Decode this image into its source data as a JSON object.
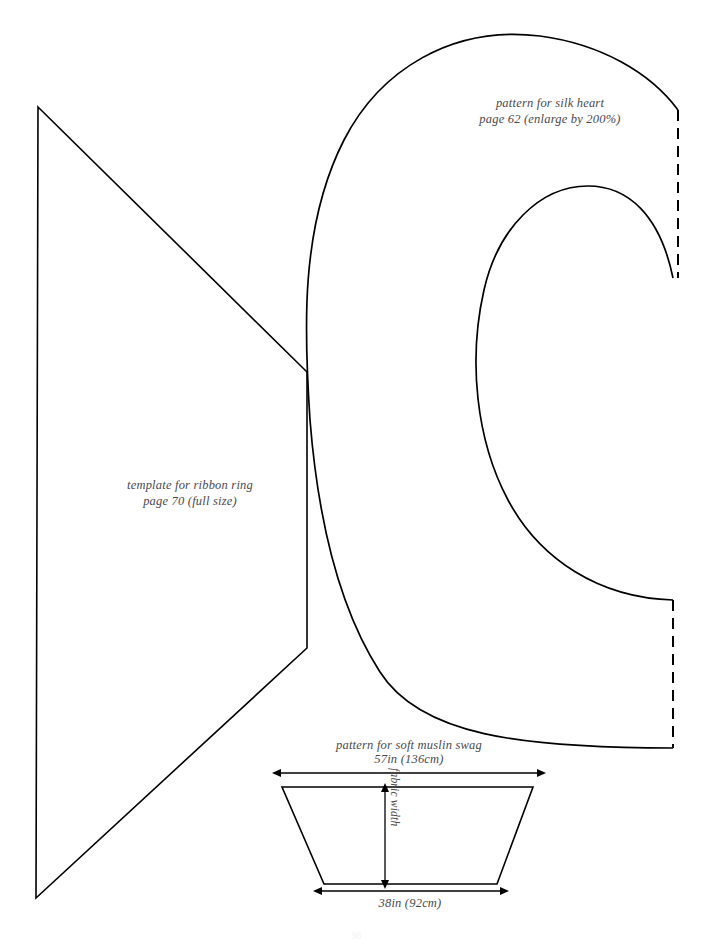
{
  "page": {
    "width": 713,
    "height": 948,
    "background": "#ffffff",
    "ink_color": "#000000",
    "text_color": "#4a4a4a",
    "page_number": "96"
  },
  "labels": {
    "silk_heart": {
      "line1": "pattern for silk heart",
      "line2": "page 62 (enlarge by 200%)"
    },
    "ribbon_ring": {
      "line1": "template for ribbon ring",
      "line2": "page 70 (full size)"
    },
    "muslin_swag": {
      "title": "pattern for soft muslin swag",
      "top_dimension": "57in (136cm)",
      "bottom_dimension": "38in (92cm)",
      "vertical_dimension": "fabric width"
    }
  },
  "shapes": {
    "ribbon_ring_template": {
      "name": "ribbon-ring-quadrilateral",
      "points": "38,107 307,372 307,648 36,898"
    },
    "silk_heart_pattern": {
      "name": "silk-heart-c-curve",
      "outer_curve": "M 678,110 C 650,72 600,44 540,36 C 452,25 380,70 344,140 C 300,226 304,330 310,420 C 318,520 340,610 380,672 C 420,735 520,748 673,748",
      "inner_curve": "M 673,600 C 600,598 540,560 508,500 C 476,440 468,360 484,290 C 498,228 540,186 588,186 C 628,186 660,215 673,278",
      "dashed_upper": "M 678,110 L 678,278",
      "dashed_lower": "M 673,600 L 673,748"
    },
    "muslin_swag_trapezoid": {
      "name": "muslin-swag-trapezoid",
      "points": "282,787 533,787 497,884 324,884"
    },
    "dimension_arrows": [
      {
        "name": "top-width-arrow",
        "from": "281,773",
        "to": "537,773",
        "orientation": "horizontal"
      },
      {
        "name": "bottom-width-arrow",
        "from": "322,891",
        "to": "500,891",
        "orientation": "horizontal"
      },
      {
        "name": "fabric-width-arrow",
        "from": "385,792",
        "to": "385,880",
        "orientation": "vertical"
      }
    ]
  }
}
